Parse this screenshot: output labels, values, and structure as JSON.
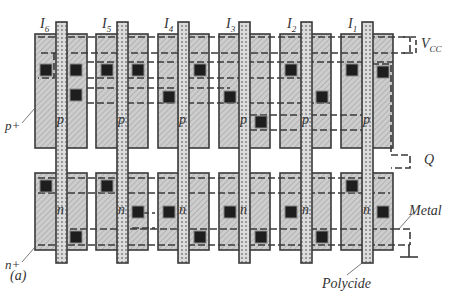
{
  "figure": {
    "caption": "(a)",
    "gate_labels": [
      "I6",
      "I5",
      "I4",
      "I3",
      "I2",
      "I1"
    ],
    "gate_label_main": [
      "I",
      "I",
      "I",
      "I",
      "I",
      "I"
    ],
    "gate_label_sub": [
      "6",
      "5",
      "4",
      "3",
      "2",
      "1"
    ],
    "channel_top": "p",
    "channel_bottom": "n",
    "diff_top_label": "p+",
    "diff_bottom_label": "n+",
    "vcc_label_main": "V",
    "vcc_label_sub": "CC",
    "output_label": "Q",
    "metal_label": "Metal",
    "poly_label": "Polycide"
  },
  "colors": {
    "diffusion_fill": "#c8c8c8",
    "outline": "#3a3a3a",
    "contact": "#1e1e1e",
    "poly_fill": "#d8d8d8",
    "label": "#333333"
  }
}
